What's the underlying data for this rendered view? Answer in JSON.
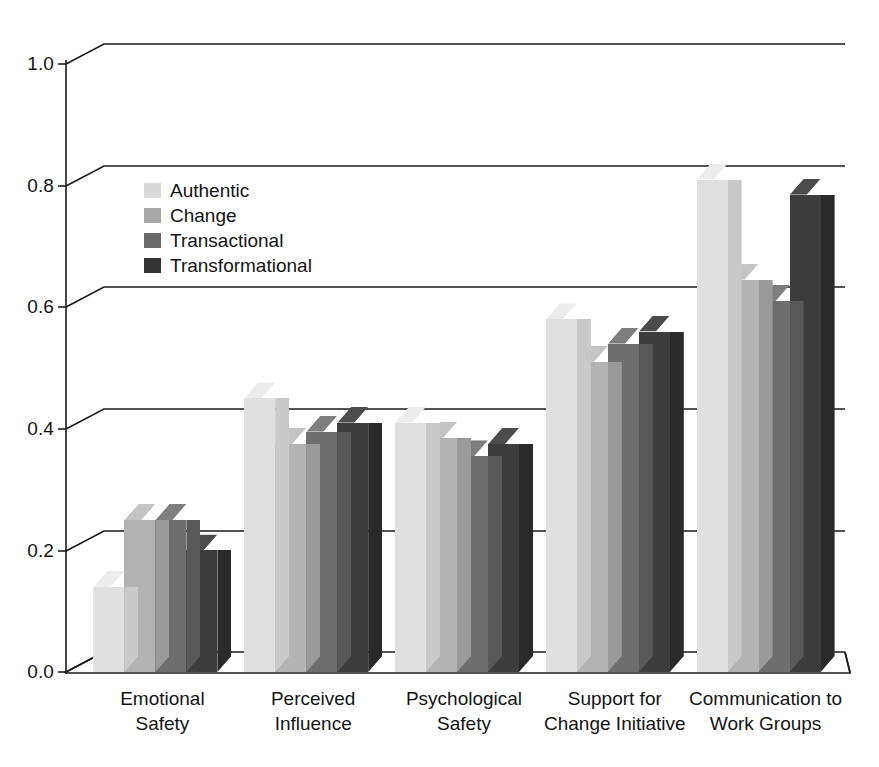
{
  "chart_data": {
    "type": "bar",
    "title": "",
    "xlabel": "",
    "ylabel": "",
    "ylim": [
      0.0,
      1.0
    ],
    "yticks": [
      0.0,
      0.2,
      0.4,
      0.6,
      0.8,
      1.0
    ],
    "yticklabels": [
      "0.0",
      "0.2",
      "0.4",
      "0.6",
      "0.8",
      "1.0"
    ],
    "grid": true,
    "grid_axis": "y",
    "three_d": true,
    "legend_position": "upper left inside",
    "categories": [
      "Emotional\nSafety",
      "Perceived\nInfluence",
      "Psychological\nSafety",
      "Support for\nChange Initiative",
      "Communication to\nWork Groups"
    ],
    "category_labels": [
      [
        "Emotional",
        "Safety"
      ],
      [
        "Perceived",
        "Influence"
      ],
      [
        "Psychological",
        "Safety"
      ],
      [
        "Support for",
        "Change Initiative"
      ],
      [
        "Communication to",
        "Work Groups"
      ]
    ],
    "series": [
      {
        "name": "Authentic",
        "color": "#e0e0e0",
        "side_color": "#c9c9c9",
        "top_color": "#ededed",
        "legend_color": "#d9d9d9",
        "values": [
          0.14,
          0.45,
          0.41,
          0.58,
          0.81
        ]
      },
      {
        "name": "Change",
        "color": "#b3b3b3",
        "side_color": "#9a9a9a",
        "top_color": "#c4c4c4",
        "legend_color": "#a8a8a8",
        "values": [
          0.25,
          0.375,
          0.385,
          0.51,
          0.645
        ]
      },
      {
        "name": "Transactional",
        "color": "#6e6e6e",
        "side_color": "#585858",
        "top_color": "#7e7e7e",
        "legend_color": "#6a6a6a",
        "values": [
          0.25,
          0.395,
          0.355,
          0.54,
          0.61
        ]
      },
      {
        "name": "Transformational",
        "color": "#3d3d3d",
        "side_color": "#2a2a2a",
        "top_color": "#4c4c4c",
        "legend_color": "#333333",
        "values": [
          0.2,
          0.41,
          0.375,
          0.56,
          0.785
        ]
      }
    ]
  },
  "geometry": {
    "baseline_y": 672,
    "top_y": 64,
    "axis_x": 66,
    "depth_x": 38,
    "depth_y": 20,
    "group_starts": [
      88,
      365,
      507,
      645,
      710
    ],
    "group_centers": [
      160,
      300,
      440,
      580,
      720
    ],
    "bar_width": 31,
    "bar_gap": 1,
    "label_top": 686
  }
}
